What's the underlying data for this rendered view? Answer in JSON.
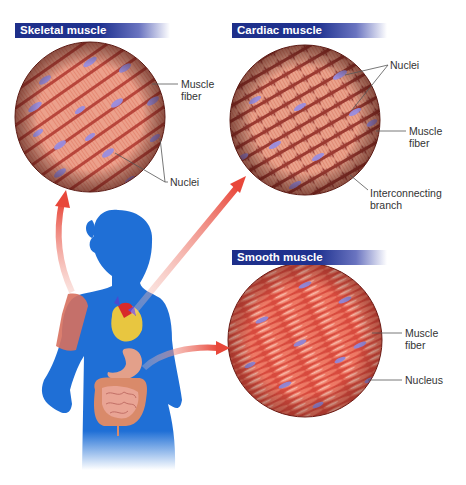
{
  "panels": {
    "skeletal": {
      "title": "Skeletal muscle",
      "labels": {
        "fiber_line1": "Muscle",
        "fiber_line2": "fiber",
        "nuclei": "Nuclei"
      }
    },
    "cardiac": {
      "title": "Cardiac muscle",
      "labels": {
        "nuclei": "Nuclei",
        "fiber_line1": "Muscle",
        "fiber_line2": "fiber",
        "branch_line1": "Interconnecting",
        "branch_line2": "branch"
      }
    },
    "smooth": {
      "title": "Smooth muscle",
      "labels": {
        "fiber_line1": "Muscle",
        "fiber_line2": "fiber",
        "nucleus": "Nucleus"
      }
    }
  },
  "colors": {
    "header_blue": "#1f3290",
    "silhouette_blue": "#1f6fd6",
    "muscle_red": "#d9574a",
    "nucleus_purple": "#8f86d8",
    "arrow_red": "#e8473a"
  }
}
